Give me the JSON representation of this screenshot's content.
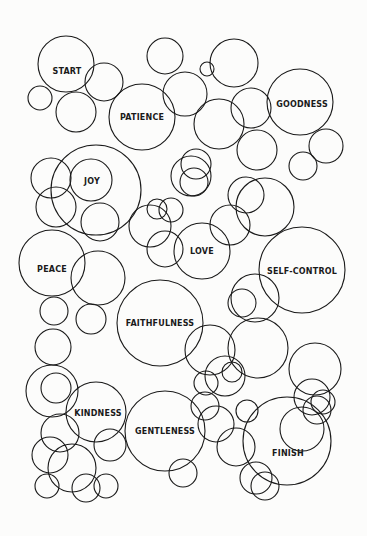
{
  "puzzle": {
    "type": "circle-maze",
    "stroke_color": "#1a1a1a",
    "background": "#fcfcfb",
    "labels": [
      {
        "id": "start",
        "text": "START",
        "x": 67,
        "y": 71
      },
      {
        "id": "patience",
        "text": "PATIENCE",
        "x": 142,
        "y": 117
      },
      {
        "id": "goodness",
        "text": "GOODNESS",
        "x": 302,
        "y": 104
      },
      {
        "id": "joy",
        "text": "JOY",
        "x": 92,
        "y": 181
      },
      {
        "id": "love",
        "text": "LOVE",
        "x": 202,
        "y": 251
      },
      {
        "id": "peace",
        "text": "PEACE",
        "x": 52,
        "y": 269
      },
      {
        "id": "self-control",
        "text": "SELF-CONTROL",
        "x": 302,
        "y": 271
      },
      {
        "id": "faithfulness",
        "text": "FAITHFULNESS",
        "x": 160,
        "y": 323
      },
      {
        "id": "kindness",
        "text": "KINDNESS",
        "x": 98,
        "y": 413
      },
      {
        "id": "gentleness",
        "text": "GENTLENESS",
        "x": 165,
        "y": 431
      },
      {
        "id": "finish",
        "text": "FINISH",
        "x": 288,
        "y": 453
      }
    ],
    "circles": [
      [
        66,
        64,
        28
      ],
      [
        104,
        82,
        19
      ],
      [
        40,
        98,
        12
      ],
      [
        76,
        112,
        20
      ],
      [
        142,
        117,
        33
      ],
      [
        165,
        56,
        18
      ],
      [
        185,
        94,
        22
      ],
      [
        207,
        69,
        7
      ],
      [
        234,
        63,
        24
      ],
      [
        219,
        124,
        25
      ],
      [
        251,
        108,
        20
      ],
      [
        300,
        102,
        33
      ],
      [
        326,
        146,
        17
      ],
      [
        303,
        166,
        14
      ],
      [
        91,
        180,
        21
      ],
      [
        51,
        178,
        20
      ],
      [
        56,
        207,
        20
      ],
      [
        96,
        190,
        45
      ],
      [
        191,
        176,
        20
      ],
      [
        196,
        164,
        15
      ],
      [
        194,
        182,
        14
      ],
      [
        257,
        150,
        20
      ],
      [
        246,
        195,
        18
      ],
      [
        157,
        209,
        10
      ],
      [
        171,
        210,
        12
      ],
      [
        150,
        226,
        21
      ],
      [
        100,
        222,
        19
      ],
      [
        230,
        225,
        20
      ],
      [
        265,
        207,
        29
      ],
      [
        202,
        251,
        28
      ],
      [
        165,
        249,
        18
      ],
      [
        52,
        263,
        33
      ],
      [
        98,
        278,
        27
      ],
      [
        302,
        270,
        43
      ],
      [
        255,
        298,
        24
      ],
      [
        242,
        303,
        14
      ],
      [
        160,
        323,
        43
      ],
      [
        91,
        319,
        15
      ],
      [
        54,
        311,
        14
      ],
      [
        53,
        347,
        18
      ],
      [
        56,
        388,
        15
      ],
      [
        60,
        433,
        19
      ],
      [
        210,
        350,
        25
      ],
      [
        225,
        376,
        20
      ],
      [
        258,
        348,
        30
      ],
      [
        315,
        369,
        26
      ],
      [
        52,
        391,
        26
      ],
      [
        96,
        412,
        30
      ],
      [
        165,
        431,
        40
      ],
      [
        110,
        445,
        16
      ],
      [
        50,
        455,
        18
      ],
      [
        72,
        468,
        24
      ],
      [
        86,
        488,
        14
      ],
      [
        47,
        486,
        12
      ],
      [
        106,
        486,
        12
      ],
      [
        183,
        473,
        14
      ],
      [
        206,
        383,
        12
      ],
      [
        232,
        372,
        10
      ],
      [
        205,
        406,
        14
      ],
      [
        247,
        411,
        11
      ],
      [
        236,
        447,
        19
      ],
      [
        256,
        478,
        16
      ],
      [
        312,
        397,
        18
      ],
      [
        317,
        410,
        14
      ],
      [
        287,
        441,
        44
      ],
      [
        265,
        486,
        14
      ],
      [
        323,
        402,
        12
      ],
      [
        216,
        424,
        18
      ],
      [
        302,
        429,
        22
      ]
    ]
  }
}
